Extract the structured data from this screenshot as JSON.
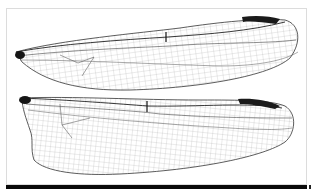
{
  "figure": {
    "panels": [
      {
        "name": "forewing",
        "pterostigma_color": "#1a1a1a"
      },
      {
        "name": "hindwing",
        "pterostigma_color": "#1a1a1a"
      }
    ],
    "colors": {
      "background": "#ffffff",
      "vein": "#555555",
      "vein_major": "#222222",
      "frame_border": "#dcdcdc",
      "caption_bar": "#0a0a0a"
    }
  }
}
